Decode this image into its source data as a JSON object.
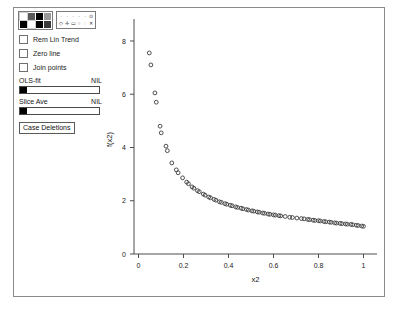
{
  "window": {
    "title": ""
  },
  "controls": {
    "palette": {
      "name": "color-palette",
      "swatches": [
        "#ffffff",
        "#5a5a5a",
        "#000000",
        "#9a9a9a",
        "#000000",
        "#ffffff",
        "#000000",
        "#3a3a3a"
      ]
    },
    "symbol_picker": {
      "name": "symbol-picker",
      "top_row": [
        "·",
        "·",
        "·",
        "·",
        "·",
        "⊙"
      ],
      "bottom_row": [
        "◇",
        "✛",
        "▭",
        "○",
        "◌",
        "✕"
      ]
    },
    "checkboxes": [
      {
        "label": "Rem Lin Trend",
        "checked": false
      },
      {
        "label": "Zero line",
        "checked": false
      },
      {
        "label": "Join points",
        "checked": false
      }
    ],
    "sliders": [
      {
        "label": "OLS-fit",
        "value": "NIL"
      },
      {
        "label": "Slice Ave",
        "value": "NIL"
      }
    ],
    "button": {
      "label": "Case Deletions"
    }
  },
  "chart_data": {
    "type": "scatter",
    "title": "",
    "xlabel": "x2",
    "ylabel": "f(x2)",
    "xlim": [
      -0.02,
      1.06
    ],
    "ylim": [
      0,
      8.6
    ],
    "xticks": [
      0,
      0.2,
      0.4,
      0.6,
      0.8,
      1
    ],
    "xticklabels": [
      "0",
      "0.2",
      "0.4",
      "0.6",
      "0.8",
      "1"
    ],
    "yticks": [
      0,
      2,
      4,
      6,
      8
    ],
    "yticklabels": [
      "0",
      "2",
      "4",
      "6",
      "8"
    ],
    "grid": false,
    "legend": null,
    "marker": "open-circle",
    "points": [
      [
        0.048,
        7.55
      ],
      [
        0.055,
        7.1
      ],
      [
        0.073,
        6.05
      ],
      [
        0.079,
        5.7
      ],
      [
        0.096,
        4.8
      ],
      [
        0.101,
        4.55
      ],
      [
        0.122,
        4.05
      ],
      [
        0.128,
        3.88
      ],
      [
        0.148,
        3.42
      ],
      [
        0.168,
        3.16
      ],
      [
        0.176,
        3.05
      ],
      [
        0.196,
        2.86
      ],
      [
        0.214,
        2.7
      ],
      [
        0.222,
        2.64
      ],
      [
        0.238,
        2.52
      ],
      [
        0.246,
        2.47
      ],
      [
        0.262,
        2.38
      ],
      [
        0.27,
        2.34
      ],
      [
        0.288,
        2.25
      ],
      [
        0.296,
        2.21
      ],
      [
        0.312,
        2.14
      ],
      [
        0.32,
        2.11
      ],
      [
        0.336,
        2.05
      ],
      [
        0.344,
        2.02
      ],
      [
        0.36,
        1.96
      ],
      [
        0.368,
        1.94
      ],
      [
        0.384,
        1.89
      ],
      [
        0.392,
        1.87
      ],
      [
        0.408,
        1.83
      ],
      [
        0.416,
        1.81
      ],
      [
        0.432,
        1.77
      ],
      [
        0.44,
        1.75
      ],
      [
        0.456,
        1.72
      ],
      [
        0.464,
        1.7
      ],
      [
        0.48,
        1.67
      ],
      [
        0.488,
        1.65
      ],
      [
        0.504,
        1.62
      ],
      [
        0.512,
        1.61
      ],
      [
        0.528,
        1.58
      ],
      [
        0.536,
        1.57
      ],
      [
        0.552,
        1.54
      ],
      [
        0.56,
        1.53
      ],
      [
        0.576,
        1.5
      ],
      [
        0.584,
        1.49
      ],
      [
        0.6,
        1.47
      ],
      [
        0.608,
        1.46
      ],
      [
        0.624,
        1.44
      ],
      [
        0.632,
        1.43
      ],
      [
        0.652,
        1.41
      ],
      [
        0.672,
        1.38
      ],
      [
        0.684,
        1.37
      ],
      [
        0.704,
        1.35
      ],
      [
        0.724,
        1.33
      ],
      [
        0.736,
        1.32
      ],
      [
        0.752,
        1.3
      ],
      [
        0.76,
        1.29
      ],
      [
        0.776,
        1.27
      ],
      [
        0.784,
        1.26
      ],
      [
        0.8,
        1.25
      ],
      [
        0.808,
        1.24
      ],
      [
        0.824,
        1.22
      ],
      [
        0.832,
        1.21
      ],
      [
        0.848,
        1.2
      ],
      [
        0.856,
        1.19
      ],
      [
        0.872,
        1.17
      ],
      [
        0.88,
        1.16
      ],
      [
        0.896,
        1.15
      ],
      [
        0.904,
        1.14
      ],
      [
        0.92,
        1.13
      ],
      [
        0.928,
        1.12
      ],
      [
        0.944,
        1.11
      ],
      [
        0.952,
        1.1
      ],
      [
        0.968,
        1.08
      ],
      [
        0.976,
        1.07
      ],
      [
        0.992,
        1.05
      ],
      [
        1.0,
        1.04
      ]
    ]
  }
}
